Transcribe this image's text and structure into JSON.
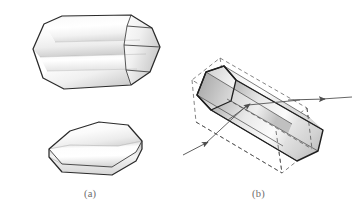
{
  "figure": {
    "background_color": "#ffffff",
    "outline_color": "#2b2b2b",
    "dashed_color": "#4a4a4a",
    "ray_color": "#555555",
    "caption_color": "#6d6d6d",
    "panels": [
      {
        "id": "a",
        "caption": "(a)",
        "description": "Two views of an octagonal prism: a long prism seen obliquely and an end-on octagonal face",
        "objects": [
          {
            "name": "octagonal-prism-oblique",
            "kind": "solid-prism",
            "faces": 8,
            "shading": "light-gray-to-white gradient bands"
          },
          {
            "name": "octagonal-prism-end-on",
            "kind": "solid-prism",
            "faces": 8,
            "shading": "light-gray-to-white gradient bands"
          }
        ]
      },
      {
        "id": "b",
        "caption": "(b)",
        "description": "Octagonal prism inscribed in a dashed rectangular box with a light ray entering at lower left and exiting at the right",
        "objects": [
          {
            "name": "octagonal-prism-inscribed",
            "kind": "solid-prism",
            "faces": 8,
            "shading": "gray gradient bands"
          },
          {
            "name": "bounding-box",
            "kind": "dashed-rectangular-box"
          },
          {
            "name": "incident-ray",
            "kind": "arrow",
            "direction": "up-right"
          },
          {
            "name": "exit-ray",
            "kind": "arrow",
            "direction": "right"
          }
        ]
      }
    ]
  }
}
